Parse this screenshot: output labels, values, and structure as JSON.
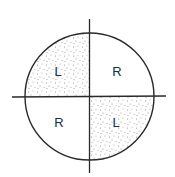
{
  "diagram": {
    "type": "quadrant-circle",
    "colors": {
      "stroke": "#2a2a2a",
      "stipple": "#8a8a8a",
      "background": "#ffffff"
    },
    "quadrants": [
      {
        "position": "top-left",
        "label": "L",
        "shaded": true
      },
      {
        "position": "top-right",
        "label": "R",
        "shaded": false
      },
      {
        "position": "bottom-left",
        "label": "R",
        "shaded": false
      },
      {
        "position": "bottom-right",
        "label": "L",
        "shaded": true
      }
    ]
  }
}
